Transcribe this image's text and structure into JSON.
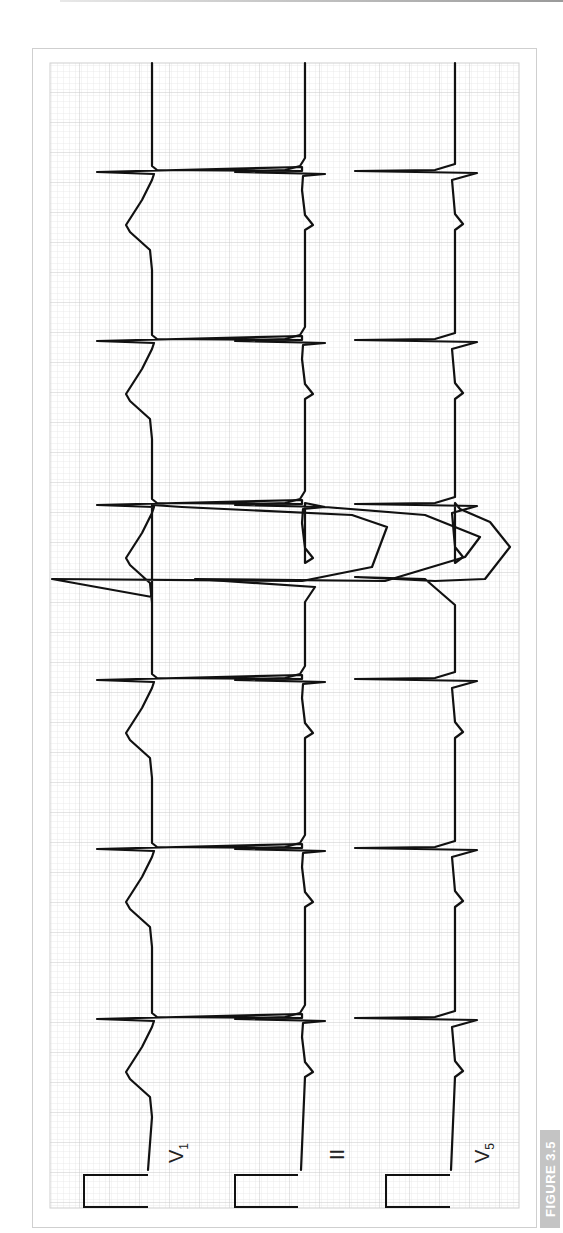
{
  "figure": {
    "tag": "FIGURE 3.5",
    "orientation": "rotated 90deg counter-clockwise (time runs bottom to top)"
  },
  "leads": [
    {
      "id": "V1",
      "label_main": "V",
      "label_sub": "1",
      "baseline_x": 152,
      "calibration": {
        "x1": 84,
        "x2": 148
      }
    },
    {
      "id": "II",
      "label_main": "II",
      "label_sub": "",
      "baseline_x": 305,
      "calibration": {
        "x1": 235,
        "x2": 298
      }
    },
    {
      "id": "V5",
      "label_main": "V",
      "label_sub": "5",
      "baseline_x": 455,
      "calibration": {
        "x1": 386,
        "x2": 450
      }
    }
  ],
  "beats": [
    {
      "index": 1,
      "y": 1017,
      "type": "sinus"
    },
    {
      "index": 2,
      "y": 847,
      "type": "sinus"
    },
    {
      "index": 3,
      "y": 678,
      "type": "sinus"
    },
    {
      "index": 4,
      "y": 577,
      "type": "premature-ventricular"
    },
    {
      "index": 5,
      "y": 503,
      "type": "sinus"
    },
    {
      "index": 6,
      "y": 339,
      "type": "sinus"
    },
    {
      "index": 7,
      "y": 170,
      "type": "sinus"
    }
  ],
  "colors": {
    "trace": "#111111",
    "grid_minor": "#e2e2e2",
    "grid_major": "#c8c8c8",
    "frame": "#cfcfcf",
    "tag_bg": "#c4c4c4"
  }
}
